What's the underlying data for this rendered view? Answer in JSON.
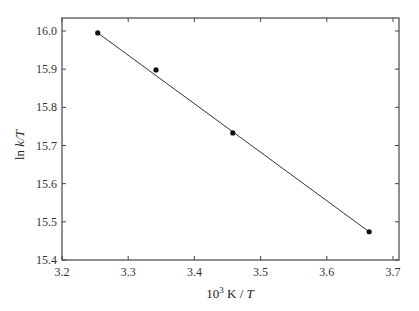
{
  "chart_data": {
    "type": "scatter",
    "title": "",
    "xlabel": "10^3 K / T",
    "xlabel_parts": {
      "base": "10",
      "sup": "3",
      "rest": " K / ",
      "italic": "T"
    },
    "ylabel": "ln k/T",
    "ylabel_parts": {
      "plain": "ln ",
      "italic": "k/T"
    },
    "xlim": [
      3.2,
      3.7
    ],
    "ylim": [
      15.4,
      16.0
    ],
    "x_ticks": [
      "3.2",
      "3.3",
      "3.4",
      "3.5",
      "3.6",
      "3.7"
    ],
    "y_ticks": [
      "15.4",
      "15.5",
      "15.6",
      "15.7",
      "15.8",
      "15.9",
      "16.0"
    ],
    "grid": false,
    "legend": null,
    "series": [
      {
        "name": "data",
        "marker": "filled-circle",
        "x": [
          3.254,
          3.342,
          3.458,
          3.664
        ],
        "y": [
          15.995,
          15.898,
          15.733,
          15.474
        ]
      },
      {
        "name": "linear fit",
        "style": "line",
        "x": [
          3.254,
          3.664
        ],
        "y": [
          15.995,
          15.474
        ]
      }
    ]
  }
}
